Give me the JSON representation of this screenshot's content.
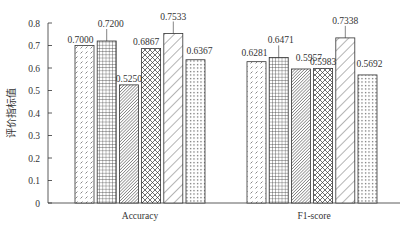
{
  "chart_data": {
    "type": "bar",
    "title": "",
    "xlabel": "",
    "ylabel": "评价指标值",
    "ylim": [
      0,
      0.8
    ],
    "yticks": [
      "0",
      "0.1",
      "0.2",
      "0.3",
      "0.4",
      "0.5",
      "0.6",
      "0.7",
      "0.8"
    ],
    "grid": false,
    "legend": "none",
    "categories": [
      "Accuracy",
      "F1-score"
    ],
    "series": [
      {
        "name": "Series 1 (dashed hatch)",
        "pattern": "dash",
        "values": [
          0.7,
          0.6281
        ]
      },
      {
        "name": "Series 2 (grid)",
        "pattern": "grid",
        "values": [
          0.72,
          0.6471
        ]
      },
      {
        "name": "Series 3 (dense diagonal)",
        "pattern": "dense-diag",
        "values": [
          0.525,
          0.5957
        ]
      },
      {
        "name": "Series 4 (crosshatch)",
        "pattern": "cross",
        "values": [
          0.6867,
          0.5983
        ]
      },
      {
        "name": "Series 5 (wide diagonal)",
        "pattern": "wide-diag",
        "values": [
          0.7533,
          0.7338
        ]
      },
      {
        "name": "Series 6 (dots)",
        "pattern": "dots",
        "values": [
          0.6367,
          0.5692
        ]
      }
    ],
    "labels": [
      [
        "0.7000",
        "0.7200",
        "0.5250",
        "0.6867",
        "0.7533",
        "0.6367"
      ],
      [
        "0.6281",
        "0.6471",
        "0.5957",
        "0.5983",
        "0.7338",
        "0.5692"
      ]
    ]
  }
}
